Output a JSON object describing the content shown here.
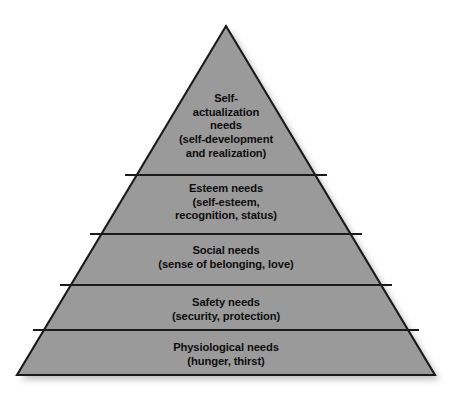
{
  "diagram": {
    "name": "maslow-hierarchy-of-needs-pyramid",
    "type": "pyramid",
    "background_color": "#ffffff",
    "fill_color": "#9a9a9a",
    "stroke_color": "#1a1a1a",
    "text_color": "#0d0d0d",
    "shadow_color": "#c9c9c9",
    "geometry": {
      "apex_x": 226,
      "apex_y": 26,
      "base_left_x": 17,
      "base_right_x": 435,
      "base_y": 375,
      "divider_y": [
        175,
        234,
        285,
        330
      ]
    },
    "tiers": [
      {
        "id": "self-actualization",
        "rank": 5,
        "position": "top",
        "title": "Self-\nactualization\nneeds",
        "detail": "(self-development\nand realization)",
        "text": "Self-\nactualization\nneeds\n(self-development\nand realization)"
      },
      {
        "id": "esteem",
        "rank": 4,
        "position": "second",
        "title": "Esteem needs",
        "detail": "(self-esteem,\nrecognition, status)",
        "text": "Esteem needs\n(self-esteem,\nrecognition, status)"
      },
      {
        "id": "social",
        "rank": 3,
        "position": "middle",
        "title": "Social needs",
        "detail": "(sense of belonging, love)",
        "text": "Social needs\n(sense of belonging, love)"
      },
      {
        "id": "safety",
        "rank": 2,
        "position": "fourth",
        "title": "Safety needs",
        "detail": "(security, protection)",
        "text": "Safety needs\n(security, protection)"
      },
      {
        "id": "physiological",
        "rank": 1,
        "position": "base",
        "title": "Physiological needs",
        "detail": "(hunger, thirst)",
        "text": "Physiological needs\n(hunger, thirst)"
      }
    ]
  }
}
